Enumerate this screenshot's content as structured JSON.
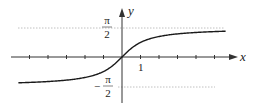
{
  "chart_data": {
    "type": "line",
    "title": "",
    "function": "y = arctan(x)",
    "xlabel": "x",
    "ylabel": "y",
    "xlim": [
      -5.6,
      6.3
    ],
    "ylim": [
      -2.5,
      2.6
    ],
    "x_ticks": [
      -5,
      -4,
      -3,
      -2,
      -1,
      1,
      2,
      3,
      4,
      5
    ],
    "x_tick_labels": [
      {
        "x": 1,
        "label": "1"
      }
    ],
    "y_tick_labels": [
      {
        "y": 1.5708,
        "num": "π",
        "den": "2",
        "sign": ""
      },
      {
        "y": -1.5708,
        "num": "π",
        "den": "2",
        "sign": "−"
      }
    ],
    "asymptotes": [
      {
        "y": 1.5708,
        "style": "dotted",
        "label": "π/2"
      },
      {
        "y": -1.5708,
        "style": "dotted",
        "label": "−π/2"
      }
    ],
    "series": [
      {
        "name": "arctan(x)",
        "x": [
          -5.6,
          -5,
          -4,
          -3,
          -2,
          -1.5,
          -1,
          -0.5,
          0,
          0.5,
          1,
          1.5,
          2,
          3,
          4,
          5,
          5.6
        ],
        "y": [
          -1.394,
          -1.373,
          -1.326,
          -1.249,
          -1.107,
          -0.983,
          -0.785,
          -0.464,
          0,
          0.464,
          0.785,
          0.983,
          1.107,
          1.249,
          1.326,
          1.373,
          1.394
        ]
      }
    ],
    "grid": false,
    "legend": null
  },
  "labels": {
    "x_axis": "x",
    "y_axis": "y",
    "one": "1",
    "pi": "π",
    "two": "2",
    "minus": "−"
  },
  "colors": {
    "curve": "#1a1a1a",
    "axis": "#333333",
    "asymptote": "#aaaaaa"
  }
}
